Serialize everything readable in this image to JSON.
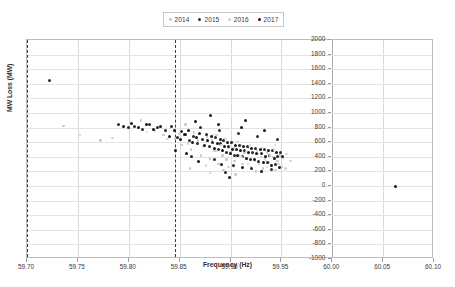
{
  "chart_data": {
    "type": "scatter",
    "title": "",
    "xlabel": "Frequency (Hz)",
    "ylabel": "MW Loss (MW)",
    "xlim": [
      59.7,
      60.1
    ],
    "ylim": [
      -1000,
      2000
    ],
    "xticks": [
      "59.70",
      "59.75",
      "59.80",
      "59.85",
      "59.90",
      "59.95",
      "60.00",
      "60.05",
      "60.10"
    ],
    "xtick_values": [
      59.7,
      59.75,
      59.8,
      59.85,
      59.9,
      59.95,
      60.0,
      60.05,
      60.1
    ],
    "yticks": [
      "2000",
      "1800",
      "1600",
      "1400",
      "1200",
      "1000",
      "800",
      "600",
      "400",
      "200",
      "0",
      "-200",
      "-400",
      "-600",
      "-800",
      "-1000"
    ],
    "ytick_values": [
      2000,
      1800,
      1600,
      1400,
      1200,
      1000,
      800,
      600,
      400,
      200,
      0,
      -200,
      -400,
      -600,
      -800,
      -1000
    ],
    "grid": true,
    "legend_position": "top-center",
    "annotations": [
      {
        "type": "vline",
        "x": 59.7,
        "style": "dashed",
        "color": "#3d3d3d"
      },
      {
        "type": "vline",
        "x": 59.845,
        "style": "dashed",
        "color": "#3d3d3d"
      }
    ],
    "series": [
      {
        "name": "2014",
        "color": "#c9c9c9",
        "marker": "circle",
        "size": 2.6,
        "points": [
          [
            59.736,
            820
          ],
          [
            59.772,
            620
          ],
          [
            59.812,
            900
          ],
          [
            59.826,
            760
          ],
          [
            59.834,
            700
          ],
          [
            59.846,
            660
          ],
          [
            59.852,
            560
          ],
          [
            59.856,
            840
          ],
          [
            59.861,
            500
          ],
          [
            59.864,
            730
          ],
          [
            59.868,
            620
          ],
          [
            59.871,
            420
          ],
          [
            59.874,
            560
          ],
          [
            59.877,
            680
          ],
          [
            59.88,
            380
          ],
          [
            59.882,
            620
          ],
          [
            59.884,
            480
          ],
          [
            59.886,
            700
          ],
          [
            59.888,
            300
          ],
          [
            59.89,
            560
          ],
          [
            59.892,
            420
          ],
          [
            59.894,
            640
          ],
          [
            59.896,
            360
          ],
          [
            59.898,
            520
          ],
          [
            59.9,
            460
          ],
          [
            59.902,
            600
          ],
          [
            59.904,
            340
          ],
          [
            59.906,
            500
          ],
          [
            59.908,
            420
          ],
          [
            59.91,
            560
          ],
          [
            59.912,
            300
          ],
          [
            59.914,
            460
          ],
          [
            59.916,
            380
          ],
          [
            59.918,
            520
          ],
          [
            59.92,
            260
          ],
          [
            59.922,
            440
          ],
          [
            59.924,
            340
          ],
          [
            59.926,
            480
          ],
          [
            59.928,
            300
          ],
          [
            59.93,
            400
          ],
          [
            59.932,
            240
          ],
          [
            59.934,
            380
          ],
          [
            59.936,
            460
          ],
          [
            59.938,
            320
          ],
          [
            59.94,
            280
          ],
          [
            59.942,
            400
          ],
          [
            59.944,
            220
          ],
          [
            59.946,
            340
          ],
          [
            59.948,
            420
          ],
          [
            59.95,
            260
          ],
          [
            59.88,
            180
          ],
          [
            59.905,
            160
          ],
          [
            59.925,
            200
          ],
          [
            59.86,
            240
          ],
          [
            59.893,
            220
          ]
        ]
      },
      {
        "name": "2015",
        "color": "#2b2b2b",
        "marker": "circle",
        "size": 3.0,
        "points": [
          [
            59.722,
            1450
          ],
          [
            59.79,
            840
          ],
          [
            59.8,
            800
          ],
          [
            59.806,
            820
          ],
          [
            59.814,
            780
          ],
          [
            59.82,
            840
          ],
          [
            59.828,
            800
          ],
          [
            59.836,
            760
          ],
          [
            59.842,
            820
          ],
          [
            59.848,
            660
          ],
          [
            59.852,
            740
          ],
          [
            59.856,
            700
          ],
          [
            59.86,
            620
          ],
          [
            59.864,
            680
          ],
          [
            59.868,
            580
          ],
          [
            59.872,
            640
          ],
          [
            59.876,
            700
          ],
          [
            59.879,
            540
          ],
          [
            59.882,
            600
          ],
          [
            59.885,
            660
          ],
          [
            59.888,
            500
          ],
          [
            59.89,
            580
          ],
          [
            59.893,
            620
          ],
          [
            59.896,
            460
          ],
          [
            59.898,
            540
          ],
          [
            59.901,
            600
          ],
          [
            59.904,
            420
          ],
          [
            59.906,
            500
          ],
          [
            59.909,
            560
          ],
          [
            59.912,
            400
          ],
          [
            59.914,
            480
          ],
          [
            59.917,
            540
          ],
          [
            59.92,
            360
          ],
          [
            59.922,
            460
          ],
          [
            59.925,
            520
          ],
          [
            59.928,
            340
          ],
          [
            59.93,
            440
          ],
          [
            59.933,
            500
          ],
          [
            59.936,
            320
          ],
          [
            59.938,
            420
          ],
          [
            59.941,
            480
          ],
          [
            59.944,
            300
          ],
          [
            59.946,
            400
          ],
          [
            59.949,
            460
          ],
          [
            59.871,
            800
          ],
          [
            59.889,
            760
          ],
          [
            59.908,
            720
          ],
          [
            59.927,
            680
          ],
          [
            59.946,
            640
          ],
          [
            59.862,
            400
          ],
          [
            59.884,
            360
          ],
          [
            59.903,
            280
          ],
          [
            59.921,
            240
          ],
          [
            59.94,
            220
          ],
          [
            59.895,
            180
          ]
        ]
      },
      {
        "name": "2016",
        "color": "#d4d4d4",
        "marker": "circle",
        "size": 2.4,
        "points": [
          [
            59.752,
            700
          ],
          [
            59.784,
            660
          ],
          [
            59.818,
            740
          ],
          [
            59.838,
            640
          ],
          [
            59.85,
            720
          ],
          [
            59.858,
            580
          ],
          [
            59.866,
            660
          ],
          [
            59.873,
            540
          ],
          [
            59.878,
            620
          ],
          [
            59.883,
            700
          ],
          [
            59.887,
            480
          ],
          [
            59.891,
            560
          ],
          [
            59.895,
            640
          ],
          [
            59.899,
            440
          ],
          [
            59.903,
            520
          ],
          [
            59.907,
            600
          ],
          [
            59.911,
            400
          ],
          [
            59.915,
            480
          ],
          [
            59.919,
            560
          ],
          [
            59.923,
            360
          ],
          [
            59.927,
            440
          ],
          [
            59.931,
            520
          ],
          [
            59.935,
            340
          ],
          [
            59.939,
            420
          ],
          [
            59.943,
            500
          ],
          [
            59.947,
            300
          ],
          [
            59.951,
            380
          ],
          [
            59.955,
            440
          ],
          [
            59.959,
            340
          ],
          [
            59.876,
            280
          ],
          [
            59.898,
            260
          ],
          [
            59.917,
            300
          ],
          [
            59.936,
            260
          ],
          [
            59.954,
            240
          ],
          [
            59.944,
            560
          ]
        ]
      },
      {
        "name": "2017",
        "color": "#1a1a1a",
        "marker": "circle",
        "size": 3.0,
        "points": [
          [
            59.795,
            820
          ],
          [
            59.803,
            860
          ],
          [
            59.81,
            800
          ],
          [
            59.817,
            840
          ],
          [
            59.824,
            780
          ],
          [
            59.831,
            820
          ],
          [
            59.84,
            680
          ],
          [
            59.845,
            760
          ],
          [
            59.851,
            640
          ],
          [
            59.855,
            700
          ],
          [
            59.859,
            760
          ],
          [
            59.863,
            600
          ],
          [
            59.867,
            660
          ],
          [
            59.87,
            720
          ],
          [
            59.874,
            560
          ],
          [
            59.877,
            620
          ],
          [
            59.881,
            680
          ],
          [
            59.884,
            520
          ],
          [
            59.887,
            580
          ],
          [
            59.89,
            640
          ],
          [
            59.892,
            480
          ],
          [
            59.894,
            540
          ],
          [
            59.897,
            600
          ],
          [
            59.9,
            440
          ],
          [
            59.902,
            500
          ],
          [
            59.905,
            560
          ],
          [
            59.907,
            420
          ],
          [
            59.91,
            480
          ],
          [
            59.913,
            540
          ],
          [
            59.916,
            380
          ],
          [
            59.918,
            460
          ],
          [
            59.921,
            520
          ],
          [
            59.924,
            360
          ],
          [
            59.926,
            440
          ],
          [
            59.929,
            500
          ],
          [
            59.932,
            320
          ],
          [
            59.934,
            400
          ],
          [
            59.937,
            480
          ],
          [
            59.94,
            280
          ],
          [
            59.943,
            380
          ],
          [
            59.945,
            460
          ],
          [
            59.948,
            260
          ],
          [
            59.866,
            880
          ],
          [
            59.888,
            840
          ],
          [
            59.911,
            800
          ],
          [
            59.933,
            760
          ],
          [
            59.869,
            340
          ],
          [
            59.891,
            300
          ],
          [
            59.912,
            260
          ],
          [
            59.93,
            200
          ],
          [
            59.899,
            120
          ],
          [
            59.88,
            960
          ],
          [
            59.915,
            900
          ],
          [
            60.062,
            0
          ],
          [
            59.846,
            480
          ],
          [
            59.857,
            440
          ],
          [
            59.951,
            400
          ]
        ]
      }
    ]
  }
}
